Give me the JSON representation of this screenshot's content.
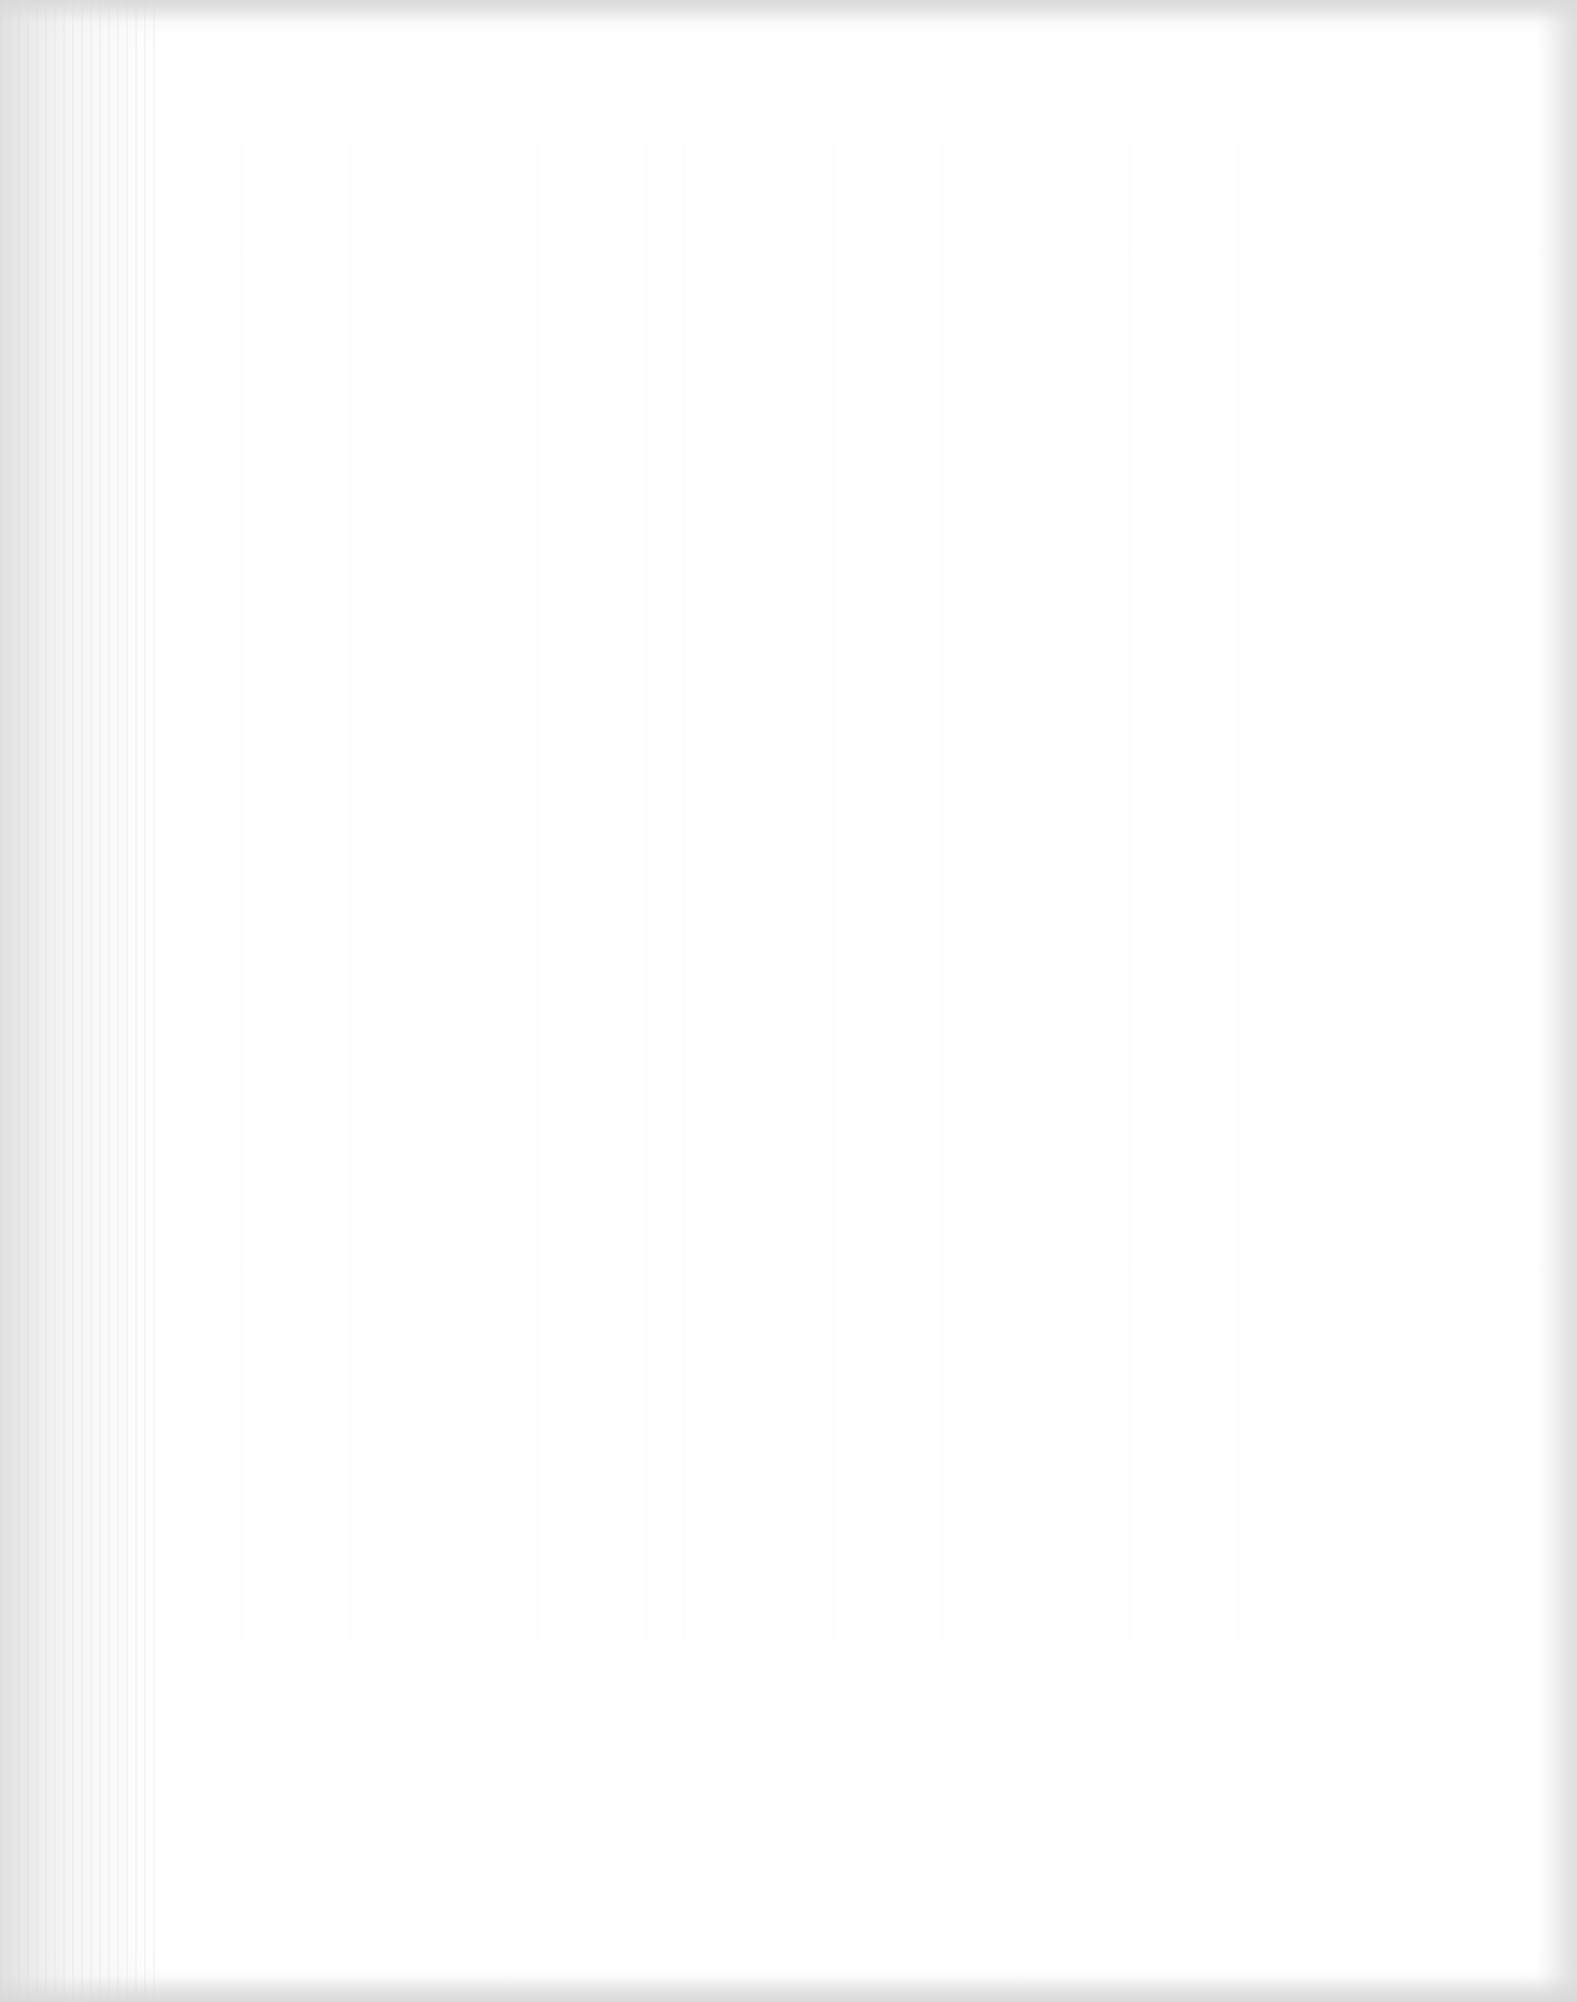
{
  "document": {
    "type": "scanned page",
    "state": "blank",
    "text": "",
    "colors": {
      "paper": "#ffffff",
      "scan_edge": "#dcdcdc"
    }
  }
}
